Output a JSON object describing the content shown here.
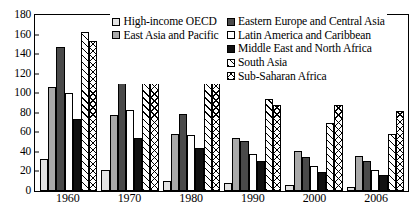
{
  "chart_data": {
    "type": "bar",
    "title": "",
    "xlabel": "",
    "ylabel": "",
    "ylim": [
      0,
      180
    ],
    "ytick_step": 20,
    "yticks": [
      180,
      160,
      140,
      120,
      100,
      80,
      60,
      40,
      20,
      0
    ],
    "grid": false,
    "legend_position": "top-center-right",
    "categories": [
      "1960",
      "1970",
      "1980",
      "1990",
      "2000",
      "2006"
    ],
    "series": [
      {
        "name": "High-income OECD",
        "fill": "light-gray",
        "values": [
          33,
          21,
          10,
          8,
          6,
          4
        ]
      },
      {
        "name": "East Asia and Pacific",
        "fill": "medium-gray",
        "values": [
          106,
          78,
          58,
          54,
          41,
          36
        ]
      },
      {
        "name": "Eastern Europe and Central Asia",
        "fill": "dark-gray",
        "values": [
          147,
          117,
          79,
          51,
          35,
          31
        ]
      },
      {
        "name": "Latin America and Caribbean",
        "fill": "white",
        "values": [
          100,
          83,
          57,
          38,
          26,
          21
        ]
      },
      {
        "name": "Middle East and North Africa",
        "fill": "black",
        "values": [
          74,
          54,
          44,
          31,
          19,
          16
        ]
      },
      {
        "name": "South Asia",
        "fill": "diagonal-hatch",
        "values": [
          163,
          142,
          119,
          94,
          70,
          58
        ]
      },
      {
        "name": "Sub-Saharan Africa",
        "fill": "cross-hatch",
        "values": [
          153,
          136,
          113,
          88,
          88,
          82
        ]
      }
    ]
  },
  "legend": {
    "column_left": [
      {
        "label": "High-income OECD",
        "swatch": "light-gray"
      },
      {
        "label": "East Asia and Pacific",
        "swatch": "medium-gray"
      }
    ],
    "column_right": [
      {
        "label": "Eastern Europe and Central Asia",
        "swatch": "dark-gray"
      },
      {
        "label": "Latin America and Caribbean",
        "swatch": "white"
      },
      {
        "label": "Middle East and North Africa",
        "swatch": "black"
      },
      {
        "label": "South Asia",
        "swatch": "diagonal-hatch"
      },
      {
        "label": "Sub-Saharan Africa",
        "swatch": "cross-hatch"
      }
    ]
  },
  "colors": {
    "light-gray": "#e3e3e3",
    "medium-gray": "#a9a9a9",
    "dark-gray": "#4a4a4a",
    "white": "#ffffff",
    "black": "#111111",
    "axis": "#000000"
  }
}
